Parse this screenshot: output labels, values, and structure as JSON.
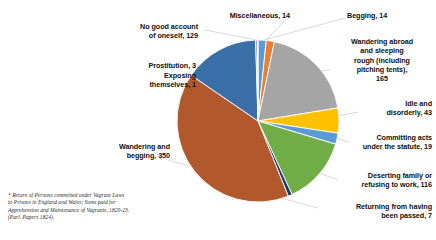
{
  "chart_data": {
    "type": "pie",
    "title": "",
    "subtitle": "",
    "xlabel": "",
    "ylabel": "",
    "legend_position": "none",
    "grid": false,
    "total": 767,
    "start_angle_deg": 0,
    "direction": "clockwise",
    "categories": [
      "Begging",
      "Miscellaneous",
      "Wandering abroad and sleeping rough (including pitching tents)",
      "Idle and disorderly",
      "Committing acts under the statute",
      "Deserting family or refusing to work",
      "Returning from having been passed",
      "Wandering and begging",
      "No good account of oneself",
      "Prostitution",
      "Exposing themselves"
    ],
    "values": [
      14,
      14,
      165,
      43,
      19,
      116,
      7,
      350,
      129,
      3,
      1
    ],
    "colors": [
      "#5b9bd5",
      "#ed7d31",
      "#a5a5a5",
      "#ffc000",
      "#5b9bd5",
      "#70ad47",
      "#1f3864",
      "#b1592c",
      "#3a6fa8",
      "#7f7f7f",
      "#c9c9c9"
    ],
    "slices": [
      {
        "label": "Begging",
        "value": 14,
        "color": "#5b9bd5"
      },
      {
        "label": "Miscellaneous",
        "value": 14,
        "color": "#ed7d31"
      },
      {
        "label": "Wandering abroad and sleeping rough (including pitching tents)",
        "value": 165,
        "color": "#a5a5a5"
      },
      {
        "label": "Idle and disorderly",
        "value": 43,
        "color": "#ffc000"
      },
      {
        "label": "Committing acts under the statute",
        "value": 19,
        "color": "#5b9bd5"
      },
      {
        "label": "Deserting family or refusing to work",
        "value": 116,
        "color": "#70ad47"
      },
      {
        "label": "Returning from having been passed",
        "value": 7,
        "color": "#1f3864"
      },
      {
        "label": "Wandering and begging",
        "value": 350,
        "color": "#b1592c"
      },
      {
        "label": "No good account of oneself",
        "value": 129,
        "color": "#3a6fa8"
      },
      {
        "label": "Prostitution",
        "value": 3,
        "color": "#7f7f7f"
      },
      {
        "label": "Exposing themselves",
        "value": 1,
        "color": "#c9c9c9"
      }
    ]
  },
  "labels": {
    "miscellaneous": "Miscellaneous, 14",
    "begging": "Begging, 14",
    "wandering_abroad": "Wandering abroad\nand sleeping\nrough (including\npitching tents),\n165",
    "idle_and_disorderly": "Idle and\ndisorderly, 43",
    "committing_acts": "Committing acts\nunder the statute, 19",
    "deserting_family": "Deserting family or\nrefusing to work, 116",
    "returning_from_having_been_passed": "Returning from having\nbeen passed, 7",
    "wandering_and_begging": "Wandering and\nbegging, 350",
    "no_good_account": "No good account\nof oneself, 129",
    "prostitution": "Prostitution, 3",
    "exposing_themselves": "Exposing\nthemselves, 1"
  },
  "footnote": {
    "text": "* Return of Persons committed under Vagrant Laws\n   to Prisons in England and Wales; Sums paid for\n   Apprehension and Maintenance of Vagrants, 1820-23.\n   (Parl. Papers 1824)."
  }
}
